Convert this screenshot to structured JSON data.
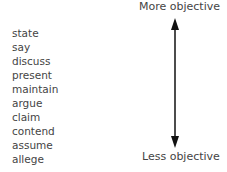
{
  "scale": {
    "top_label": "More objective",
    "bottom_label": "Less objective",
    "arrow_color": "#111111",
    "text_color": "#444444"
  },
  "words": [
    "state",
    "say",
    "discuss",
    "present",
    "maintain",
    "argue",
    "claim",
    "contend",
    "assume",
    "allege"
  ]
}
